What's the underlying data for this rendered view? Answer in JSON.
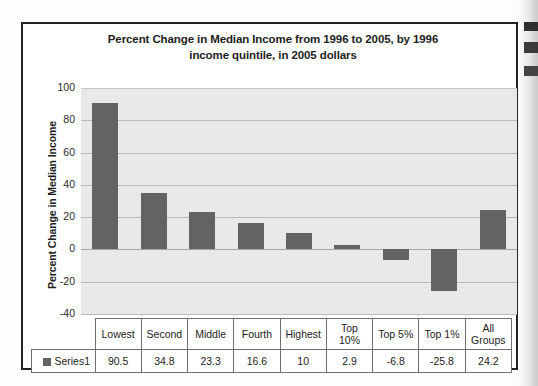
{
  "chart_data": {
    "type": "bar",
    "title": "Percent Change in Median Income from 1996 to 2005, by 1996 income quintile, in 2005 dollars",
    "title_line1": "Percent Change in Median Income from 1996 to 2005, by 1996",
    "title_line2": "income quintile, in 2005 dollars",
    "xlabel": "",
    "ylabel": "Percent Change in Median Income",
    "ylim": [
      -40,
      100
    ],
    "ytick_labels": [
      "100",
      "80",
      "60",
      "40",
      "20",
      "0",
      "-20",
      "-40"
    ],
    "yticks": [
      100,
      80,
      60,
      40,
      20,
      0,
      -20,
      -40
    ],
    "grid": true,
    "legend_position": "table-below",
    "series_name": "Series1",
    "bar_color": "#636363",
    "plot_background": "#e9e9e9",
    "categories": [
      "Lowest",
      "Second",
      "Middle",
      "Fourth",
      "Highest",
      "Top 10%",
      "Top 5%",
      "Top 1%",
      "All Groups"
    ],
    "category_lines": [
      [
        "Lowest"
      ],
      [
        "Second"
      ],
      [
        "Middle"
      ],
      [
        "Fourth"
      ],
      [
        "Highest"
      ],
      [
        "Top",
        "10%"
      ],
      [
        "Top 5%"
      ],
      [
        "Top 1%"
      ],
      [
        "All",
        "Groups"
      ]
    ],
    "values": [
      90.5,
      34.8,
      23.3,
      16.6,
      10,
      2.9,
      -6.8,
      -25.8,
      24.2
    ],
    "value_labels": [
      "90.5",
      "34.8",
      "23.3",
      "16.6",
      "10",
      "2.9",
      "-6.8",
      "-25.8",
      "24.2"
    ]
  },
  "table": {
    "legend_label": "Series1"
  }
}
